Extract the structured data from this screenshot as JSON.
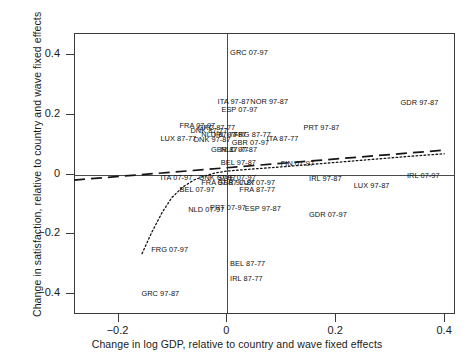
{
  "chart_data": {
    "type": "scatter",
    "title": "",
    "xlabel": "Change in log GDP, relative to country and wave fixed effects",
    "ylabel": "Change in satisfaction, relative to country and wave fixed effects",
    "xlim": [
      -0.28,
      0.42
    ],
    "ylim": [
      -0.47,
      0.47
    ],
    "xticks": [
      -0.2,
      0,
      0.2,
      0.4
    ],
    "xticklabels": [
      "−0.2",
      "0",
      "0.2",
      "0.4"
    ],
    "yticks": [
      0.4,
      0.2,
      0,
      -0.2,
      -0.4
    ],
    "yticklabels": [
      "0.4",
      "0.2",
      "0",
      "−0.2",
      "−0.4"
    ],
    "grid": false,
    "legend": false,
    "zero_lines": true,
    "point_marker": "text-label-only",
    "points": [
      {
        "label": "GRC 07-97",
        "x": 0.005,
        "y": 0.405
      },
      {
        "label": "ITA 97-87",
        "x": -0.018,
        "y": 0.243
      },
      {
        "label": "NOR 97-87",
        "x": 0.042,
        "y": 0.241
      },
      {
        "label": "GDR 97-87",
        "x": 0.318,
        "y": 0.24
      },
      {
        "label": "ESP 07-97",
        "x": -0.011,
        "y": 0.217
      },
      {
        "label": "FRA 07-97",
        "x": -0.088,
        "y": 0.163
      },
      {
        "label": "GRC 87-77",
        "x": -0.055,
        "y": 0.155
      },
      {
        "label": "DNK 87-77",
        "x": -0.068,
        "y": 0.145
      },
      {
        "label": "PRT 97-87",
        "x": 0.14,
        "y": 0.155
      },
      {
        "label": "NLD 87-77",
        "x": -0.048,
        "y": 0.131
      },
      {
        "label": "IRL 97-87",
        "x": -0.025,
        "y": 0.131
      },
      {
        "label": "FRG 87-77",
        "x": 0.012,
        "y": 0.131
      },
      {
        "label": "LUX 87-77",
        "x": -0.123,
        "y": 0.119
      },
      {
        "label": "DNK 97-87",
        "x": -0.062,
        "y": 0.114
      },
      {
        "label": "ITA 87-77",
        "x": 0.072,
        "y": 0.12
      },
      {
        "label": "GBR 07-97",
        "x": 0.008,
        "y": 0.104
      },
      {
        "label": "GBR 87-77",
        "x": -0.03,
        "y": 0.081
      },
      {
        "label": "NLD 97-87",
        "x": -0.012,
        "y": 0.081
      },
      {
        "label": "BEL 97-87",
        "x": -0.012,
        "y": 0.04
      },
      {
        "label": "FIN 07-97",
        "x": 0.098,
        "y": 0.036
      },
      {
        "label": "ITA 07-97",
        "x": -0.123,
        "y": -0.012
      },
      {
        "label": "DNK 07-97",
        "x": -0.052,
        "y": -0.012
      },
      {
        "label": "SWE 07-97",
        "x": -0.018,
        "y": -0.012
      },
      {
        "label": "IRL 97-87",
        "x": 0.15,
        "y": -0.015
      },
      {
        "label": "IRL 07-97",
        "x": 0.33,
        "y": -0.005
      },
      {
        "label": "FRA 97-87",
        "x": -0.048,
        "y": -0.03
      },
      {
        "label": "GBR 97-87",
        "x": -0.018,
        "y": -0.03
      },
      {
        "label": "LUX 07-97",
        "x": 0.022,
        "y": -0.03
      },
      {
        "label": "LUX 97-87",
        "x": 0.232,
        "y": -0.04
      },
      {
        "label": "BEL 07-97",
        "x": -0.088,
        "y": -0.052
      },
      {
        "label": "FRA 87-77",
        "x": 0.022,
        "y": -0.052
      },
      {
        "label": "NLD 07-97",
        "x": -0.072,
        "y": -0.12
      },
      {
        "label": "PRT 07-97",
        "x": -0.032,
        "y": -0.112
      },
      {
        "label": "ESP 97-87",
        "x": 0.032,
        "y": -0.115
      },
      {
        "label": "GDR 07-97",
        "x": 0.15,
        "y": -0.135
      },
      {
        "label": "FRG 07-97",
        "x": -0.14,
        "y": -0.252
      },
      {
        "label": "BEL 87-77",
        "x": 0.005,
        "y": -0.3
      },
      {
        "label": "IRL 87-77",
        "x": 0.005,
        "y": -0.35
      },
      {
        "label": "GRC 97-87",
        "x": -0.158,
        "y": -0.4
      }
    ],
    "fit_lines": [
      {
        "name": "dashed-linear-fit",
        "style": "dashed",
        "points": [
          [
            -0.28,
            -0.022
          ],
          [
            0.4,
            0.078
          ]
        ]
      },
      {
        "name": "dotted-nonparametric-fit",
        "style": "dotted",
        "points": [
          [
            -0.155,
            -0.268
          ],
          [
            -0.138,
            -0.2
          ],
          [
            -0.118,
            -0.13
          ],
          [
            -0.1,
            -0.08
          ],
          [
            -0.08,
            -0.045
          ],
          [
            -0.06,
            -0.022
          ],
          [
            -0.04,
            -0.008
          ],
          [
            -0.02,
            0.002
          ],
          [
            0.0,
            0.008
          ],
          [
            0.04,
            0.014
          ],
          [
            0.1,
            0.022
          ],
          [
            0.18,
            0.034
          ],
          [
            0.26,
            0.046
          ],
          [
            0.34,
            0.058
          ],
          [
            0.4,
            0.066
          ]
        ]
      }
    ]
  }
}
